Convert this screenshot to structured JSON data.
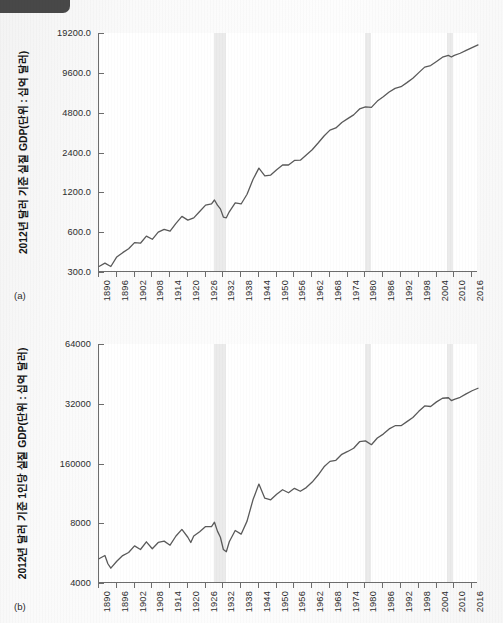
{
  "figure": {
    "background_color": "#fbfbfb",
    "line_color": "#5a5a5a",
    "recession_band_color": "#ebebeb",
    "axis_color": "#6d6d6d"
  },
  "corner_chip": {
    "name": "clipped-ui-chip",
    "color": "#484848"
  },
  "panels": [
    {
      "tag": "(a)"
    },
    {
      "tag": "(b)"
    }
  ],
  "chart_data": [
    {
      "type": "line",
      "panel": "(a)",
      "title": "",
      "xlabel": "",
      "ylabel": "2012년 달러 기준 실질 GDP(단위 : 십억 달러)",
      "yscale": "log",
      "ylim": [
        300.0,
        19200.0
      ],
      "yticks": [
        300.0,
        600.0,
        1200.0,
        2400.0,
        4800.0,
        9600.0,
        19200.0
      ],
      "ytick_labels": [
        "300.0",
        "600.0",
        "1200.0",
        "2400.0",
        "4800.0",
        "9600.0",
        "19200.0"
      ],
      "xlim": [
        1890,
        2018
      ],
      "xticks": [
        1890,
        1896,
        1902,
        1908,
        1914,
        1920,
        1926,
        1932,
        1938,
        1944,
        1950,
        1956,
        1962,
        1968,
        1974,
        1980,
        1986,
        1992,
        1998,
        2004,
        2010,
        2016
      ],
      "xtick_labels": [
        "1890",
        "1896",
        "1902",
        "1908",
        "1914",
        "1920",
        "1926",
        "1932",
        "1938",
        "1944",
        "1950",
        "1956",
        "1962",
        "1968",
        "1974",
        "1980",
        "1986",
        "1992",
        "1998",
        "2004",
        "2010",
        "2016"
      ],
      "grid": false,
      "legend": "none",
      "shaded_regions": [
        {
          "label": "대공황",
          "x0": 1929,
          "x1": 1933
        },
        {
          "label": "1980년대 초 불황",
          "x0": 1980,
          "x1": 1982
        },
        {
          "label": "대침체",
          "x0": 2007.5,
          "x1": 2009.5
        }
      ],
      "x": [
        1890,
        1892,
        1894,
        1896,
        1898,
        1900,
        1902,
        1904,
        1906,
        1908,
        1910,
        1912,
        1914,
        1916,
        1918,
        1920,
        1922,
        1924,
        1926,
        1928,
        1929,
        1930,
        1931,
        1932,
        1933,
        1934,
        1936,
        1938,
        1940,
        1942,
        1944,
        1946,
        1948,
        1950,
        1952,
        1954,
        1956,
        1958,
        1960,
        1962,
        1964,
        1966,
        1968,
        1970,
        1972,
        1974,
        1976,
        1978,
        1980,
        1982,
        1984,
        1986,
        1988,
        1990,
        1992,
        1994,
        1996,
        1998,
        2000,
        2002,
        2004,
        2006,
        2008,
        2009,
        2010,
        2012,
        2014,
        2016,
        2018
      ],
      "y": [
        330,
        350,
        330,
        390,
        420,
        450,
        500,
        495,
        560,
        530,
        600,
        630,
        610,
        700,
        790,
        740,
        770,
        860,
        960,
        980,
        1050,
        960,
        900,
        780,
        770,
        855,
        1000,
        980,
        1160,
        1500,
        1830,
        1600,
        1620,
        1780,
        1930,
        1930,
        2090,
        2100,
        2300,
        2520,
        2830,
        3200,
        3540,
        3680,
        4050,
        4330,
        4620,
        5120,
        5310,
        5260,
        5870,
        6330,
        6870,
        7330,
        7540,
        8100,
        8730,
        9630,
        10600,
        10900,
        11700,
        12600,
        13000,
        12650,
        13000,
        13500,
        14200,
        14900,
        15600
      ],
      "line_color": "#5a5a5a",
      "line_width": 1.3
    },
    {
      "type": "line",
      "panel": "(b)",
      "title": "",
      "xlabel": "",
      "ylabel": "2012년 달러 기준 1인당 실질 GDP(단위 : 십억 달러)",
      "yscale": "log",
      "ylim": [
        4000,
        64000
      ],
      "yticks": [
        4000,
        8000,
        16000,
        32000,
        64000
      ],
      "ytick_labels": [
        "4000",
        "8000",
        "160000",
        "32000",
        "64000"
      ],
      "xlim": [
        1890,
        2018
      ],
      "xticks": [
        1890,
        1896,
        1902,
        1908,
        1914,
        1920,
        1926,
        1932,
        1938,
        1944,
        1950,
        1956,
        1962,
        1968,
        1974,
        1980,
        1986,
        1992,
        1998,
        2004,
        2010,
        2016
      ],
      "xtick_labels": [
        "1890",
        "1896",
        "1902",
        "1908",
        "1914",
        "1920",
        "1926",
        "1932",
        "1938",
        "1944",
        "1950",
        "1956",
        "1962",
        "1968",
        "1974",
        "1980",
        "1986",
        "1992",
        "1998",
        "2004",
        "2010",
        "2016"
      ],
      "grid": false,
      "legend": "none",
      "shaded_regions": [
        {
          "label": "대공황",
          "x0": 1929,
          "x1": 1933
        },
        {
          "label": "1980년대 초 불황",
          "x0": 1980,
          "x1": 1982
        },
        {
          "label": "대침체",
          "x0": 2007.5,
          "x1": 2009.5
        }
      ],
      "x": [
        1890,
        1892,
        1893,
        1894,
        1896,
        1898,
        1900,
        1902,
        1904,
        1906,
        1908,
        1910,
        1912,
        1914,
        1916,
        1918,
        1920,
        1921,
        1922,
        1924,
        1926,
        1928,
        1929,
        1930,
        1931,
        1932,
        1933,
        1934,
        1936,
        1938,
        1940,
        1942,
        1944,
        1946,
        1948,
        1950,
        1952,
        1954,
        1956,
        1958,
        1960,
        1962,
        1964,
        1966,
        1968,
        1970,
        1972,
        1974,
        1976,
        1978,
        1980,
        1982,
        1984,
        1986,
        1988,
        1990,
        1992,
        1994,
        1996,
        1998,
        2000,
        2002,
        2004,
        2006,
        2008,
        2009,
        2010,
        2012,
        2014,
        2016,
        2018
      ],
      "y": [
        5300,
        5500,
        5000,
        4750,
        5150,
        5500,
        5700,
        6150,
        5900,
        6450,
        5950,
        6400,
        6500,
        6200,
        6900,
        7450,
        6800,
        6400,
        6900,
        7250,
        7700,
        7700,
        8100,
        7300,
        6800,
        5900,
        5750,
        6450,
        7350,
        7050,
        8200,
        10500,
        12600,
        10700,
        10500,
        11200,
        11800,
        11400,
        12000,
        11600,
        12100,
        12900,
        14000,
        15400,
        16400,
        16600,
        17800,
        18400,
        19100,
        20600,
        20800,
        19900,
        21500,
        22500,
        23900,
        24800,
        24800,
        26000,
        27300,
        29300,
        31200,
        31000,
        32700,
        34100,
        34300,
        33200,
        33700,
        34500,
        35900,
        37200,
        38300
      ],
      "line_color": "#5a5a5a",
      "line_width": 1.3
    }
  ]
}
